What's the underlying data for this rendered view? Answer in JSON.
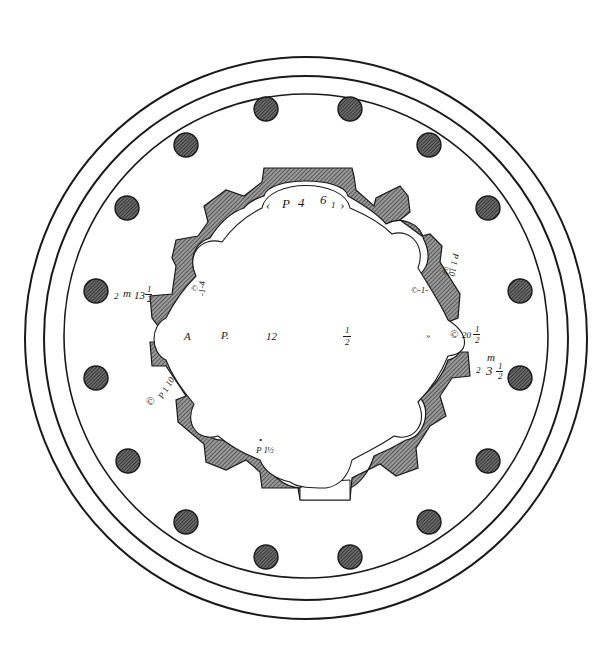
{
  "figure": {
    "colors": {
      "ink": "#1a1a1a",
      "hatch": "#555555",
      "column_fill": "#4a4a4a",
      "paper": "#ffffff"
    },
    "rings": [
      {
        "name": "outer-step",
        "r": 280
      },
      {
        "name": "middle-step",
        "r": 262
      },
      {
        "name": "stylobate",
        "r": 243
      }
    ],
    "center": {
      "x": 306,
      "y": 336
    },
    "columns": [
      {
        "x": 266,
        "y": 109
      },
      {
        "x": 350,
        "y": 109
      },
      {
        "x": 186,
        "y": 145
      },
      {
        "x": 429,
        "y": 145
      },
      {
        "x": 127,
        "y": 208
      },
      {
        "x": 488,
        "y": 208
      },
      {
        "x": 96,
        "y": 291
      },
      {
        "x": 520,
        "y": 291
      },
      {
        "x": 96,
        "y": 378
      },
      {
        "x": 520,
        "y": 378
      },
      {
        "x": 128,
        "y": 461
      },
      {
        "x": 488,
        "y": 461
      },
      {
        "x": 186,
        "y": 522
      },
      {
        "x": 429,
        "y": 522
      },
      {
        "x": 266,
        "y": 557
      },
      {
        "x": 350,
        "y": 557
      }
    ],
    "column_radius": 12
  },
  "labels": {
    "top_niche": {
      "p": "P",
      "num": "4",
      "scroll": "6",
      "sub": "1"
    },
    "center_row": {
      "a": "A",
      "p": "P.",
      "n12": "12",
      "half_num": "1",
      "half_den": "2",
      "arrow": "»"
    },
    "right_door": {
      "scroll": "©",
      "value": "20",
      "frac_num": "1",
      "frac_den": "2"
    },
    "left_side": {
      "two": "2",
      "m": "m",
      "value": "13",
      "frac_num": "1",
      "frac_den": "2"
    },
    "right_lower": {
      "two": "2",
      "m": "m",
      "value": "3",
      "frac_num": "1",
      "frac_den": "2"
    },
    "upper_left_niche": {
      "text": "-1-4",
      "sub": "a"
    },
    "upper_right_niche": {
      "text": "P 1 10",
      "scroll": "©"
    },
    "upper_right_small": {
      "text": "©-1-",
      "sub": "2"
    },
    "lower_left_niche": {
      "text": "P 1 10",
      "scroll": "©"
    },
    "lower_left_small": {
      "dot": "•",
      "text": "P 1",
      "frac": "½"
    }
  }
}
